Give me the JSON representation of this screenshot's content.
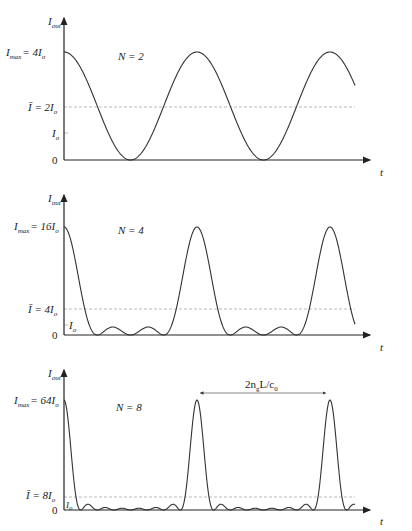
{
  "panels": [
    {
      "id": "n2",
      "label_N": "N = 2",
      "y_axis_label": "I",
      "y_axis_label_sub": "out",
      "imax_label": "I",
      "imax_label_sub": "max",
      "imax_value": "= 4I",
      "imax_value_sub": "o",
      "iavg_label": "Ī = 2I",
      "iavg_label_sub": "o",
      "io_label": "I",
      "io_label_sub": "o",
      "zero_label": "0",
      "x_axis_label": "t"
    },
    {
      "id": "n4",
      "label_N": "N = 4",
      "y_axis_label": "I",
      "y_axis_label_sub": "out",
      "imax_label": "I",
      "imax_label_sub": "max",
      "imax_value": "= 16I",
      "imax_value_sub": "o",
      "iavg_label": "Ī = 4I",
      "iavg_label_sub": "o",
      "io_label": "I",
      "io_label_sub": "o",
      "zero_label": "0",
      "x_axis_label": "t"
    },
    {
      "id": "n8",
      "label_N": "N = 8",
      "y_axis_label": "I",
      "y_axis_label_sub": "out",
      "imax_label": "I",
      "imax_label_sub": "max",
      "imax_value": "= 64I",
      "imax_value_sub": "o",
      "iavg_label": "Ī = 8I",
      "iavg_label_sub": "o",
      "io_label": "I",
      "io_label_sub": "o",
      "zero_label": "0",
      "x_axis_label": "t",
      "period_label": "2n",
      "period_label_sub": "g",
      "period_label_rest": "L/c",
      "period_label_sub2": "0"
    }
  ],
  "chart_data": [
    {
      "type": "line",
      "title": "N = 2",
      "xlabel": "t",
      "ylabel": "I_out",
      "y_ticks": [
        "0",
        "I_o",
        "Ī = 2I_o",
        "I_max = 4I_o"
      ],
      "peak_value": "4I_o",
      "mean_value": "2I_o",
      "function": "I_o * sin^2(N*phi/2)/sin^2(phi/2), N=2",
      "peaks_visible": 3
    },
    {
      "type": "line",
      "title": "N = 4",
      "xlabel": "t",
      "ylabel": "I_out",
      "y_ticks": [
        "0",
        "I_o",
        "Ī = 4I_o",
        "I_max = 16I_o"
      ],
      "peak_value": "16I_o",
      "mean_value": "4I_o",
      "function": "I_o * sin^2(N*phi/2)/sin^2(phi/2), N=4",
      "peaks_visible": 3
    },
    {
      "type": "line",
      "title": "N = 8",
      "xlabel": "t",
      "ylabel": "I_out",
      "y_ticks": [
        "0",
        "I_o",
        "Ī = 8I_o",
        "I_max = 64I_o"
      ],
      "peak_value": "64I_o",
      "mean_value": "8I_o",
      "function": "I_o * sin^2(N*phi/2)/sin^2(phi/2), N=8",
      "peaks_visible": 3,
      "annotation": "2n_g L/c_0 (period between peaks)"
    }
  ],
  "geometry": {
    "x0": 64,
    "period_px": 133,
    "x_end": 355,
    "panels": [
      {
        "N": 2,
        "zero_y": 160,
        "peak_y": 52,
        "avg_y": 107,
        "io_y": 133,
        "top_y": 18
      },
      {
        "N": 4,
        "zero_y": 335,
        "peak_y": 227,
        "avg_y": 309,
        "io_y": 325,
        "top_y": 195
      },
      {
        "N": 8,
        "zero_y": 510,
        "peak_y": 400,
        "avg_y": 497,
        "io_y": 504,
        "top_y": 370
      }
    ]
  }
}
